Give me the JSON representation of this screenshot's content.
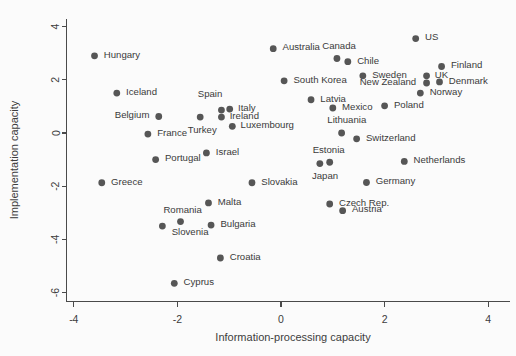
{
  "chart_data": {
    "type": "scatter",
    "title": "",
    "xlabel": "Information-processing capacity",
    "ylabel": "Implementation capacity",
    "xlim": [
      -4.4,
      4.4
    ],
    "ylim": [
      -6.6,
      4.4
    ],
    "xticks": [
      -4,
      -2,
      0,
      2,
      4
    ],
    "yticks": [
      4,
      2,
      0,
      -2,
      -4,
      -6
    ],
    "xtick_labels": [
      "-4",
      "-2",
      "0",
      "2",
      "4"
    ],
    "ytick_labels": [
      "4",
      "2",
      "0",
      "-2",
      "-4",
      "-6"
    ],
    "grid": false,
    "legend": "none",
    "marker_color": "#565656",
    "axis_color": "#4a4a4a",
    "points": [
      {
        "label": "Hungary",
        "x": -3.6,
        "y": 2.9,
        "lx": 0.18,
        "ly": 0.06,
        "anchor": "start"
      },
      {
        "label": "Iceland",
        "x": -3.17,
        "y": 1.5,
        "lx": 0.18,
        "ly": 0.06,
        "anchor": "start"
      },
      {
        "label": "Belgium",
        "x": -2.36,
        "y": 0.62,
        "lx": -0.18,
        "ly": 0.06,
        "anchor": "end"
      },
      {
        "label": "France",
        "x": -2.57,
        "y": -0.04,
        "lx": 0.18,
        "ly": 0.06,
        "anchor": "start"
      },
      {
        "label": "Portugal",
        "x": -2.42,
        "y": -1.0,
        "lx": 0.18,
        "ly": 0.06,
        "anchor": "start"
      },
      {
        "label": "Greece",
        "x": -3.46,
        "y": -1.87,
        "lx": 0.18,
        "ly": 0.06,
        "anchor": "start"
      },
      {
        "label": "Turkey",
        "x": -1.56,
        "y": 0.6,
        "lx": 0.04,
        "ly": -0.46,
        "anchor": "middle"
      },
      {
        "label": "Spain",
        "x": -1.15,
        "y": 0.86,
        "lx": -0.22,
        "ly": 0.62,
        "anchor": "middle"
      },
      {
        "label": "Italy",
        "x": -0.99,
        "y": 0.9,
        "lx": 0.16,
        "ly": 0.06,
        "anchor": "start"
      },
      {
        "label": "Ireland",
        "x": -1.15,
        "y": 0.6,
        "lx": 0.16,
        "ly": 0.06,
        "anchor": "start"
      },
      {
        "label": "Luxembourg",
        "x": -0.94,
        "y": 0.25,
        "lx": 0.16,
        "ly": 0.06,
        "anchor": "start"
      },
      {
        "label": "Israel",
        "x": -1.44,
        "y": -0.75,
        "lx": 0.18,
        "ly": 0.06,
        "anchor": "start"
      },
      {
        "label": "Malta",
        "x": -1.4,
        "y": -2.63,
        "lx": 0.18,
        "ly": 0.06,
        "anchor": "start"
      },
      {
        "label": "Romania",
        "x": -1.94,
        "y": -3.33,
        "lx": 0.04,
        "ly": 0.46,
        "anchor": "middle"
      },
      {
        "label": "Slovenia",
        "x": -2.29,
        "y": -3.5,
        "lx": 0.18,
        "ly": -0.22,
        "anchor": "start"
      },
      {
        "label": "Bulgaria",
        "x": -1.35,
        "y": -3.46,
        "lx": 0.18,
        "ly": 0.06,
        "anchor": "start"
      },
      {
        "label": "Croatia",
        "x": -1.17,
        "y": -4.7,
        "lx": 0.18,
        "ly": 0.06,
        "anchor": "start"
      },
      {
        "label": "Cyprus",
        "x": -2.06,
        "y": -5.65,
        "lx": 0.18,
        "ly": 0.06,
        "anchor": "start"
      },
      {
        "label": "Slovakia",
        "x": -0.56,
        "y": -1.87,
        "lx": 0.18,
        "ly": 0.06,
        "anchor": "start"
      },
      {
        "label": "Australia",
        "x": -0.15,
        "y": 3.17,
        "lx": 0.18,
        "ly": 0.06,
        "anchor": "start"
      },
      {
        "label": "South Korea",
        "x": 0.06,
        "y": 1.96,
        "lx": 0.18,
        "ly": 0.06,
        "anchor": "start"
      },
      {
        "label": "Canada",
        "x": 1.08,
        "y": 2.8,
        "lx": 0.04,
        "ly": 0.5,
        "anchor": "middle"
      },
      {
        "label": "Chile",
        "x": 1.29,
        "y": 2.68,
        "lx": 0.18,
        "ly": 0.06,
        "anchor": "start"
      },
      {
        "label": "Sweden",
        "x": 1.58,
        "y": 2.15,
        "lx": 0.18,
        "ly": 0.06,
        "anchor": "start"
      },
      {
        "label": "New Zealand",
        "x": 2.81,
        "y": 1.88,
        "lx": -0.2,
        "ly": 0.06,
        "anchor": "end"
      },
      {
        "label": "US",
        "x": 2.6,
        "y": 3.55,
        "lx": 0.18,
        "ly": 0.06,
        "anchor": "start"
      },
      {
        "label": "Finland",
        "x": 3.1,
        "y": 2.5,
        "lx": 0.18,
        "ly": 0.06,
        "anchor": "start"
      },
      {
        "label": "UK",
        "x": 2.81,
        "y": 2.15,
        "lx": 0.16,
        "ly": 0.06,
        "anchor": "start"
      },
      {
        "label": "Denmark",
        "x": 3.06,
        "y": 1.92,
        "lx": 0.18,
        "ly": 0.06,
        "anchor": "start"
      },
      {
        "label": "Norway",
        "x": 2.69,
        "y": 1.5,
        "lx": 0.18,
        "ly": 0.06,
        "anchor": "start"
      },
      {
        "label": "Latvia",
        "x": 0.58,
        "y": 1.25,
        "lx": 0.18,
        "ly": 0.06,
        "anchor": "start"
      },
      {
        "label": "Mexico",
        "x": 1.0,
        "y": 0.94,
        "lx": 0.18,
        "ly": 0.06,
        "anchor": "start"
      },
      {
        "label": "Poland",
        "x": 2.0,
        "y": 1.02,
        "lx": 0.18,
        "ly": 0.06,
        "anchor": "start"
      },
      {
        "label": "Lithuania",
        "x": 1.17,
        "y": 0.0,
        "lx": 0.1,
        "ly": 0.5,
        "anchor": "middle"
      },
      {
        "label": "Switzerland",
        "x": 1.46,
        "y": -0.22,
        "lx": 0.18,
        "ly": 0.06,
        "anchor": "start"
      },
      {
        "label": "Estonia",
        "x": 0.94,
        "y": -1.1,
        "lx": -0.02,
        "ly": 0.46,
        "anchor": "middle"
      },
      {
        "label": "Japan",
        "x": 0.75,
        "y": -1.15,
        "lx": 0.1,
        "ly": -0.44,
        "anchor": "middle"
      },
      {
        "label": "Netherlands",
        "x": 2.38,
        "y": -1.07,
        "lx": 0.18,
        "ly": 0.06,
        "anchor": "start"
      },
      {
        "label": "Germany",
        "x": 1.65,
        "y": -1.86,
        "lx": 0.18,
        "ly": 0.06,
        "anchor": "start"
      },
      {
        "label": "Czech Rep.",
        "x": 0.94,
        "y": -2.67,
        "lx": 0.18,
        "ly": 0.06,
        "anchor": "start"
      },
      {
        "label": "Austria",
        "x": 1.19,
        "y": -2.92,
        "lx": 0.18,
        "ly": 0.06,
        "anchor": "start"
      }
    ]
  }
}
